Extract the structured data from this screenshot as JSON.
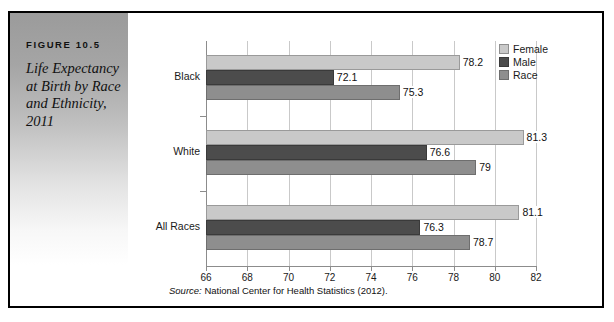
{
  "figure": {
    "number": "FIGURE 10.5",
    "title": "Life Expectancy at Birth by Race and Ethnicity, 2011"
  },
  "source": {
    "lead": "Source:",
    "text": " National Center for Health Statistics (2012)."
  },
  "colors": {
    "female": "#c9c9c9",
    "male": "#4c4c4c",
    "race": "#8e8e8e",
    "frame": "#000000",
    "grid": "#c9c9c9"
  },
  "chart_data": {
    "type": "bar",
    "orientation": "horizontal",
    "title": "Life Expectancy at Birth by Race and Ethnicity, 2011",
    "xlabel": "",
    "ylabel": "",
    "xlim": [
      66,
      82
    ],
    "xticks": [
      66,
      68,
      70,
      72,
      74,
      76,
      78,
      80,
      82
    ],
    "xtick_labels": [
      "66",
      "68",
      "70",
      "72",
      "74",
      "76",
      "78",
      "80",
      "82"
    ],
    "grid": true,
    "legend_position": "top-right",
    "categories": [
      "Black",
      "White",
      "All Races"
    ],
    "series": [
      {
        "name": "Female",
        "values": [
          78.2,
          81.3,
          81.1
        ],
        "labels": [
          "78.2",
          "81.3",
          "81.1"
        ]
      },
      {
        "name": "Male",
        "values": [
          72.1,
          76.6,
          76.3
        ],
        "labels": [
          "72.1",
          "76.6",
          "76.3"
        ]
      },
      {
        "name": "Race",
        "values": [
          75.3,
          79.0,
          78.7
        ],
        "labels": [
          "75.3",
          "79",
          "78.7"
        ]
      }
    ]
  }
}
